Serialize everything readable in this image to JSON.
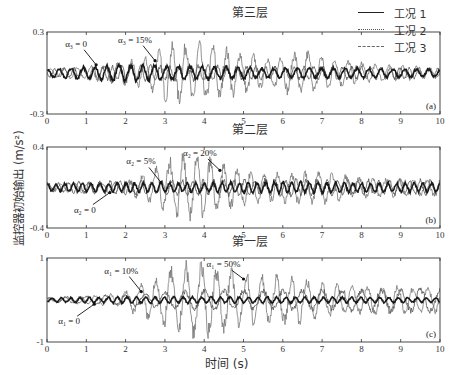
{
  "chart_data": {
    "type": "line",
    "shared": {
      "xlabel": "时间 (s)",
      "ylabel": "监控器初始输出 (m/s²)",
      "xlim": [
        0,
        10
      ],
      "xticks": [
        "0",
        "1",
        "2",
        "3",
        "4",
        "5",
        "6",
        "7",
        "8",
        "9",
        "10"
      ],
      "legend": [
        {
          "label": "工况 1",
          "style": "solid"
        },
        {
          "label": "工况 2",
          "style": "dotted"
        },
        {
          "label": "工况 3",
          "style": "dashed"
        }
      ],
      "legend_position": "top-right"
    },
    "panels": [
      {
        "id": "a",
        "title": "第三层",
        "tag": "(a)",
        "ylim": [
          -0.3,
          0.3
        ],
        "yticks": [
          "0.3",
          "-0.3"
        ],
        "annotations": [
          {
            "text": "α₃ = 0",
            "x": 1.25,
            "y": 0.06
          },
          {
            "text": "α₃ = 15%",
            "x": 2.75,
            "y": 0.09
          }
        ],
        "series": [
          {
            "name": "工况 1",
            "style": "solid",
            "envelope": [
              [
                0,
                0.03
              ],
              [
                1,
                0.05
              ],
              [
                2,
                0.07
              ],
              [
                3,
                0.06
              ],
              [
                4,
                0.05
              ],
              [
                6,
                0.04
              ],
              [
                8,
                0.04
              ],
              [
                10,
                0.03
              ]
            ],
            "freq": 3.3
          },
          {
            "name": "工况 2",
            "style": "dotted",
            "envelope": [
              [
                0,
                0.03
              ],
              [
                1,
                0.05
              ],
              [
                2,
                0.09
              ],
              [
                2.6,
                0.12
              ],
              [
                3,
                0.2
              ],
              [
                3.7,
                0.24
              ],
              [
                4.5,
                0.19
              ],
              [
                5.5,
                0.12
              ],
              [
                6.5,
                0.17
              ],
              [
                7.5,
                0.1
              ],
              [
                8.5,
                0.06
              ],
              [
                10,
                0.04
              ]
            ],
            "freq": 2.9
          },
          {
            "name": "工况 3",
            "style": "dashed",
            "envelope": [
              [
                0,
                0.03
              ],
              [
                2,
                0.06
              ],
              [
                4,
                0.06
              ],
              [
                6,
                0.05
              ],
              [
                8,
                0.05
              ],
              [
                10,
                0.04
              ]
            ],
            "freq": 4.1
          }
        ]
      },
      {
        "id": "b",
        "title": "第二层",
        "tag": "(b)",
        "ylim": [
          -0.4,
          0.4
        ],
        "yticks": [
          "0.4",
          "-0.4"
        ],
        "annotations": [
          {
            "text": "α₂ = 0",
            "x": 1.6,
            "y": -0.05
          },
          {
            "text": "α₂ = 5%",
            "x": 2.9,
            "y": 0.05
          },
          {
            "text": "α₂ = 20%",
            "x": 4.4,
            "y": 0.17
          }
        ],
        "series": [
          {
            "name": "工况 1",
            "style": "solid",
            "envelope": [
              [
                0,
                0.04
              ],
              [
                2,
                0.05
              ],
              [
                4,
                0.05
              ],
              [
                6,
                0.06
              ],
              [
                8,
                0.05
              ],
              [
                10,
                0.05
              ]
            ],
            "freq": 4.5
          },
          {
            "name": "工况 2",
            "style": "dotted",
            "envelope": [
              [
                0,
                0.04
              ],
              [
                2,
                0.06
              ],
              [
                2.6,
                0.15
              ],
              [
                3,
                0.28
              ],
              [
                3.7,
                0.36
              ],
              [
                4.5,
                0.24
              ],
              [
                5.5,
                0.14
              ],
              [
                6.8,
                0.18
              ],
              [
                8,
                0.1
              ],
              [
                10,
                0.08
              ]
            ],
            "freq": 2.9
          },
          {
            "name": "工况 3",
            "style": "dashed",
            "envelope": [
              [
                0,
                0.05
              ],
              [
                2,
                0.07
              ],
              [
                4,
                0.08
              ],
              [
                6,
                0.09
              ],
              [
                8,
                0.08
              ],
              [
                10,
                0.08
              ]
            ],
            "freq": 3.8
          }
        ]
      },
      {
        "id": "c",
        "title": "第一层",
        "tag": "(c)",
        "ylim": [
          -1,
          1
        ],
        "yticks": [
          "1",
          "-1"
        ],
        "annotations": [
          {
            "text": "α₁ = 0",
            "x": 1.2,
            "y": -0.1
          },
          {
            "text": "α₁ = 10%",
            "x": 2.4,
            "y": 0.2
          },
          {
            "text": "α₁ = 50%",
            "x": 5.0,
            "y": 0.5
          }
        ],
        "series": [
          {
            "name": "工况 1",
            "style": "solid",
            "envelope": [
              [
                0,
                0.05
              ],
              [
                2,
                0.08
              ],
              [
                4,
                0.08
              ],
              [
                6,
                0.08
              ],
              [
                8,
                0.07
              ],
              [
                10,
                0.06
              ]
            ],
            "freq": 4.2
          },
          {
            "name": "工况 2",
            "style": "dotted",
            "envelope": [
              [
                0,
                0.05
              ],
              [
                1.8,
                0.15
              ],
              [
                2.4,
                0.4
              ],
              [
                3,
                0.7
              ],
              [
                3.8,
                0.95
              ],
              [
                4.5,
                0.75
              ],
              [
                5.5,
                0.6
              ],
              [
                6.5,
                0.55
              ],
              [
                7.5,
                0.35
              ],
              [
                8.5,
                0.35
              ],
              [
                10,
                0.3
              ]
            ],
            "freq": 2.6
          },
          {
            "name": "工况 3",
            "style": "dashed",
            "envelope": [
              [
                0,
                0.06
              ],
              [
                2,
                0.15
              ],
              [
                4,
                0.25
              ],
              [
                6,
                0.25
              ],
              [
                8,
                0.28
              ],
              [
                10,
                0.3
              ]
            ],
            "freq": 2.0
          }
        ]
      }
    ]
  }
}
